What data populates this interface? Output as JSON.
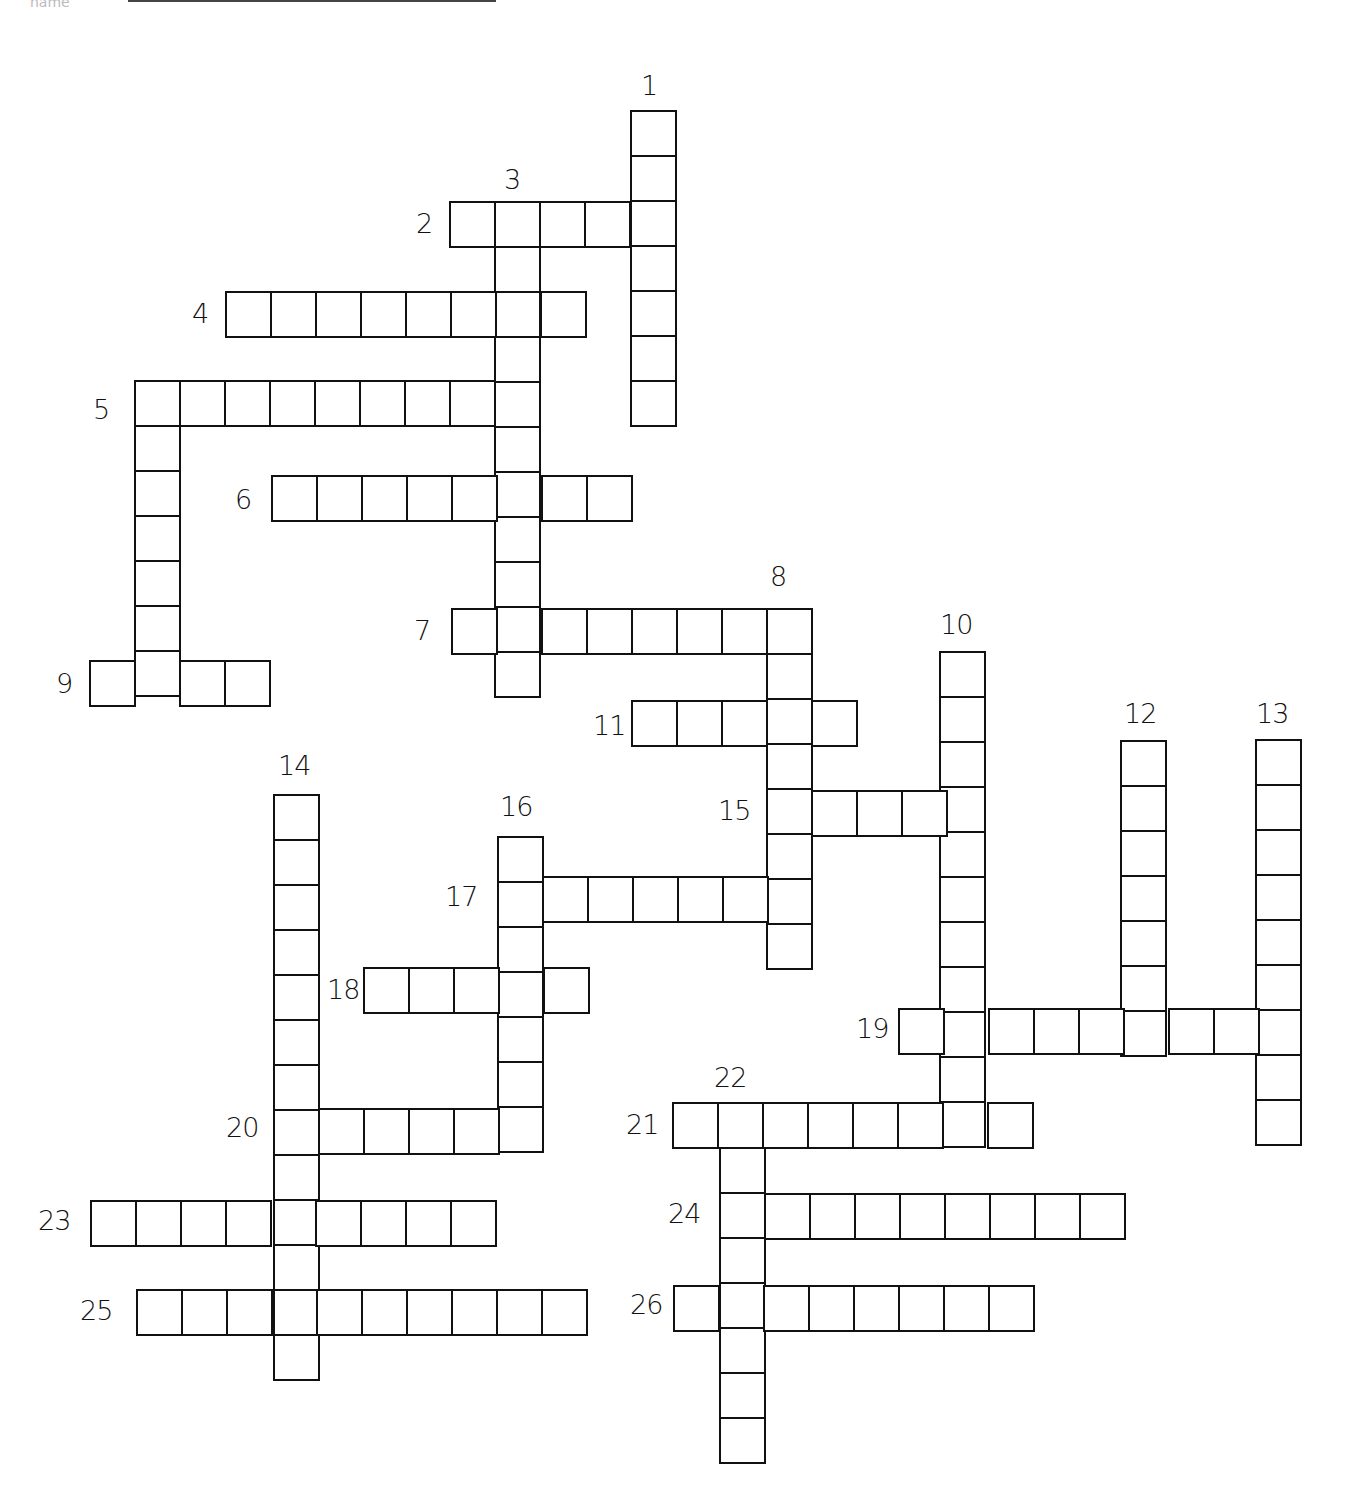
{
  "page": {
    "top_fragment": "name",
    "underline": true
  },
  "grid": {
    "cell_size": 45,
    "line_color": "#111111",
    "background": "#ffffff"
  },
  "entries": [
    {
      "number": "1",
      "dir": "down",
      "x": 630,
      "y": 110,
      "length": 7,
      "label_x": 641,
      "label_y": 72
    },
    {
      "number": "2",
      "dir": "across",
      "x": 449,
      "y": 201,
      "length": 5,
      "label_x": 416,
      "label_y": 210
    },
    {
      "number": "3",
      "dir": "down",
      "x": 494,
      "y": 201,
      "length": 11,
      "label_x": 504,
      "label_y": 166
    },
    {
      "number": "4",
      "dir": "across",
      "x": 225,
      "y": 291,
      "length": 8,
      "label_x": 192,
      "label_y": 300
    },
    {
      "number": "5",
      "dir": "across",
      "x": 134,
      "y": 380,
      "length": 9,
      "label_x": 93,
      "label_y": 396
    },
    {
      "number": "5d",
      "dir": "down",
      "x": 134,
      "y": 380,
      "length": 7,
      "label_x": null,
      "label_y": null
    },
    {
      "number": "6",
      "dir": "across",
      "x": 271,
      "y": 475,
      "length": 8,
      "label_x": 235,
      "label_y": 486
    },
    {
      "number": "7",
      "dir": "across",
      "x": 451,
      "y": 608,
      "length": 8,
      "label_x": 414,
      "label_y": 617
    },
    {
      "number": "8",
      "dir": "down",
      "x": 766,
      "y": 608,
      "length": 8,
      "label_x": 770,
      "label_y": 563
    },
    {
      "number": "9",
      "dir": "across",
      "x": 89,
      "y": 660,
      "length": 4,
      "label_x": 56,
      "label_y": 670
    },
    {
      "number": "10",
      "dir": "down",
      "x": 939,
      "y": 651,
      "length": 11,
      "label_x": 940,
      "label_y": 611
    },
    {
      "number": "11",
      "dir": "across",
      "x": 631,
      "y": 700,
      "length": 5,
      "label_x": 593,
      "label_y": 712
    },
    {
      "number": "12",
      "dir": "down",
      "x": 1120,
      "y": 740,
      "length": 7,
      "label_x": 1124,
      "label_y": 700
    },
    {
      "number": "13",
      "dir": "down",
      "x": 1255,
      "y": 739,
      "length": 9,
      "label_x": 1256,
      "label_y": 700
    },
    {
      "number": "14",
      "dir": "down",
      "x": 273,
      "y": 794,
      "length": 13,
      "label_x": 278,
      "label_y": 752
    },
    {
      "number": "15",
      "dir": "across",
      "x": 766,
      "y": 790,
      "length": 5,
      "label_x": 718,
      "label_y": 797
    },
    {
      "number": "16",
      "dir": "down",
      "x": 497,
      "y": 836,
      "length": 7,
      "label_x": 500,
      "label_y": 793
    },
    {
      "number": "17",
      "dir": "across",
      "x": 497,
      "y": 876,
      "length": 7,
      "label_x": 445,
      "label_y": 883
    },
    {
      "number": "18",
      "dir": "across",
      "x": 363,
      "y": 967,
      "length": 5,
      "label_x": 327,
      "label_y": 976
    },
    {
      "number": "19",
      "dir": "across",
      "x": 898,
      "y": 1008,
      "length": 9,
      "label_x": 856,
      "label_y": 1015
    },
    {
      "number": "20",
      "dir": "across",
      "x": 273,
      "y": 1108,
      "length": 6,
      "label_x": 226,
      "label_y": 1114
    },
    {
      "number": "21",
      "dir": "across",
      "x": 672,
      "y": 1102,
      "length": 8,
      "label_x": 626,
      "label_y": 1111
    },
    {
      "number": "22",
      "dir": "down",
      "x": 719,
      "y": 1102,
      "length": 8,
      "label_x": 714,
      "label_y": 1064
    },
    {
      "number": "23",
      "dir": "across",
      "x": 90,
      "y": 1200,
      "length": 9,
      "label_x": 38,
      "label_y": 1207
    },
    {
      "number": "24",
      "dir": "across",
      "x": 719,
      "y": 1193,
      "length": 9,
      "label_x": 668,
      "label_y": 1200
    },
    {
      "number": "25",
      "dir": "across",
      "x": 136,
      "y": 1289,
      "length": 10,
      "label_x": 80,
      "label_y": 1297
    },
    {
      "number": "26",
      "dir": "across",
      "x": 673,
      "y": 1285,
      "length": 8,
      "label_x": 630,
      "label_y": 1291
    }
  ]
}
